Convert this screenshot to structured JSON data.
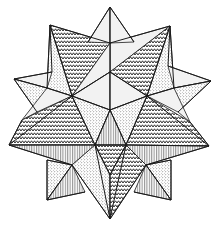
{
  "figure": {
    "colors": {
      "background": "#ffffff",
      "ink": "#1a1a1a",
      "light_face": "#f2f2f2"
    },
    "patterns": [
      "zigzag-hatch",
      "stipple-dots",
      "vertical-lines",
      "plain-light"
    ],
    "faces": [
      {
        "name": "top-left-zigzag",
        "pattern": "zigzag",
        "points": "110,43 50,25 72,96"
      },
      {
        "name": "top-left-stipple",
        "pattern": "dots",
        "points": "50,25 72,96 47,88"
      },
      {
        "name": "top-right-light",
        "pattern": "light",
        "points": "110,43 170,26 110,72"
      },
      {
        "name": "top-right-zigzag",
        "pattern": "zigzag",
        "points": "170,26 110,72 147,96"
      },
      {
        "name": "top-right-stipple",
        "pattern": "dots",
        "points": "170,26 147,96 174,88"
      },
      {
        "name": "apex-left-light",
        "pattern": "light",
        "points": "110,7 88,42 110,43"
      },
      {
        "name": "apex-right-light",
        "pattern": "light",
        "points": "110,7 134,42 110,43"
      },
      {
        "name": "upper-center-light-left",
        "pattern": "light",
        "points": "110,43 72,96 110,72"
      },
      {
        "name": "center-left-light",
        "pattern": "light",
        "points": "72,96 110,72 110,110"
      },
      {
        "name": "center-right-light",
        "pattern": "light",
        "points": "147,96 110,72 110,110"
      },
      {
        "name": "left-tip-light",
        "pattern": "light",
        "points": "14,79 47,88 52,72"
      },
      {
        "name": "left-tip-stipple",
        "pattern": "dots",
        "points": "14,79 47,88 37,112"
      },
      {
        "name": "left-light-band",
        "pattern": "light",
        "points": "47,88 72,96 37,112 22,120"
      },
      {
        "name": "right-tip-light",
        "pattern": "light",
        "points": "211,81 174,88 168,66"
      },
      {
        "name": "right-tip-stipple",
        "pattern": "dots",
        "points": "211,81 174,88 178,112"
      },
      {
        "name": "right-light-band",
        "pattern": "light",
        "points": "174,88 147,96 178,112 190,122"
      },
      {
        "name": "left-zigzag",
        "pattern": "zigzag",
        "points": "22,120 72,96 95,145 9,145"
      },
      {
        "name": "mid-left-stipple",
        "pattern": "dots",
        "points": "72,96 110,110 95,145"
      },
      {
        "name": "mid-right-stipple",
        "pattern": "dots",
        "points": "147,96 110,110 126,145"
      },
      {
        "name": "right-zigzag",
        "pattern": "zigzag",
        "points": "190,122 147,96 126,145 209,146"
      },
      {
        "name": "center-vertical",
        "pattern": "vertical",
        "points": "110,110 95,145 126,145"
      },
      {
        "name": "far-left-vertical",
        "pattern": "vertical",
        "points": "9,145 95,145 72,165"
      },
      {
        "name": "far-right-vertical",
        "pattern": "vertical",
        "points": "209,146 126,145 146,165"
      },
      {
        "name": "lower-center-zigzag",
        "pattern": "zigzag",
        "points": "95,145 126,145 110,175"
      },
      {
        "name": "lower-left-stipple",
        "pattern": "dots",
        "points": "72,165 95,145 110,175 110,219"
      },
      {
        "name": "lower-right-zigzag",
        "pattern": "zigzag",
        "points": "146,165 126,145 110,175 110,219"
      },
      {
        "name": "lower-left-square-stipple",
        "pattern": "dots",
        "points": "47,160 72,165 47,200"
      },
      {
        "name": "lower-left-square-vertical",
        "pattern": "vertical",
        "points": "72,165 47,200 85,192"
      },
      {
        "name": "lower-right-square-stipple",
        "pattern": "dots",
        "points": "171,160 146,165 171,200"
      },
      {
        "name": "lower-right-square-vertical",
        "pattern": "vertical",
        "points": "146,165 171,200 134,192"
      }
    ],
    "edges": [
      "110,7 88,42",
      "110,7 134,42",
      "110,7 110,43",
      "50,25 110,43",
      "50,25 72,96",
      "50,25 47,88",
      "50,25 52,72",
      "170,26 110,43",
      "170,26 147,96",
      "170,26 174,88",
      "170,26 168,66",
      "14,79 52,72",
      "14,79 47,88",
      "14,79 37,112",
      "211,81 168,66",
      "211,81 174,88",
      "211,81 178,112",
      "9,145 22,120",
      "9,145 72,96",
      "9,145 95,145",
      "9,145 72,165",
      "209,146 190,122",
      "209,146 147,96",
      "209,146 126,145",
      "209,146 146,165",
      "47,200 47,160",
      "47,200 72,165",
      "47,200 85,192",
      "171,200 171,160",
      "171,200 146,165",
      "171,200 134,192",
      "110,219 72,165",
      "110,219 146,165",
      "110,219 110,175",
      "110,219 95,145",
      "110,219 126,145",
      "110,43 110,110",
      "72,96 110,72",
      "147,96 110,72",
      "72,96 110,110",
      "147,96 110,110",
      "110,110 95,145",
      "110,110 126,145",
      "72,96 95,145",
      "147,96 126,145",
      "95,145 126,145",
      "95,145 110,175",
      "126,145 110,175",
      "47,88 72,96",
      "174,88 147,96",
      "72,165 47,160",
      "146,165 171,160"
    ]
  }
}
